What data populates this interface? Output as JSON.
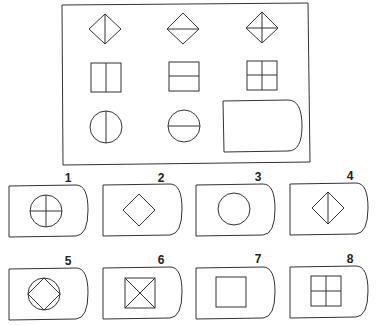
{
  "puzzle": {
    "matrix": [
      [
        {
          "shape": "diamond",
          "lines": "vertical"
        },
        {
          "shape": "diamond",
          "lines": "horizontal"
        },
        {
          "shape": "diamond",
          "lines": "both"
        }
      ],
      [
        {
          "shape": "square",
          "lines": "vertical"
        },
        {
          "shape": "square",
          "lines": "horizontal"
        },
        {
          "shape": "square",
          "lines": "both"
        }
      ],
      [
        {
          "shape": "circle",
          "lines": "vertical"
        },
        {
          "shape": "circle",
          "lines": "horizontal"
        },
        {
          "shape": "blank",
          "lines": "missing"
        }
      ]
    ],
    "options": [
      {
        "label": "1",
        "content": "circle with cross"
      },
      {
        "label": "2",
        "content": "diamond"
      },
      {
        "label": "3",
        "content": "circle"
      },
      {
        "label": "4",
        "content": "diamond with vertical line"
      },
      {
        "label": "5",
        "content": "diamond inscribed in circle"
      },
      {
        "label": "6",
        "content": "square with diagonals"
      },
      {
        "label": "7",
        "content": "square"
      },
      {
        "label": "8",
        "content": "square with cross"
      }
    ]
  },
  "labels": {
    "o1": "1",
    "o2": "2",
    "o3": "3",
    "o4": "4",
    "o5": "5",
    "o6": "6",
    "o7": "7",
    "o8": "8"
  }
}
